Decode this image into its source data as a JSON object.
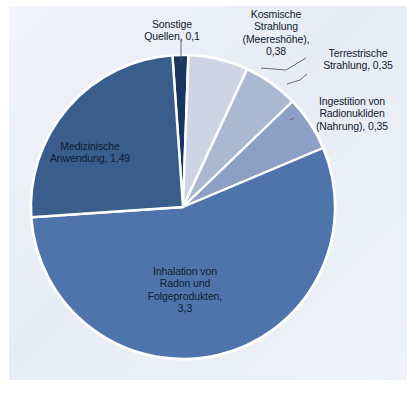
{
  "figure": {
    "background_color": "#e2e8f4",
    "page_color": "#ffffff",
    "slice_border_color": "#ffffff",
    "leader_line_color": "#5a5a5a",
    "text_color": "#0f1a2e"
  },
  "chart_data": {
    "type": "pie",
    "title": "",
    "subtitle": "",
    "xlabel": "",
    "ylabel": "",
    "legend_position": "none",
    "grid": false,
    "total": 5.97,
    "unit_separator_decimal": ",",
    "start_angle_deg": -4,
    "direction": "clockwise",
    "categories": [
      "Sonstige Quellen",
      "Kosmische Strahlung (Meereshöhe)",
      "Terrestrische Strahlung",
      "Ingestition von Radionukliden (Nahrung)",
      "Inhalation von Radon und Folgeprodukten",
      "Medizinische Anwendung"
    ],
    "values": [
      0.1,
      0.38,
      0.35,
      0.35,
      3.3,
      1.49
    ],
    "colors": [
      "#1b3561",
      "#cdd5e4",
      "#aab8d2",
      "#8ba0c4",
      "#4e74ab",
      "#3a5e8c"
    ],
    "slices": [
      {
        "name": "sonstige-quellen",
        "label": "Sonstige\nQuellen, 0,1",
        "value": 0.1,
        "color": "#1b3561",
        "label_placement": "callout"
      },
      {
        "name": "kosmische-strahlung",
        "label": "Kosmische\nStrahlung\n(Meereshöhe),\n0,38",
        "value": 0.38,
        "color": "#cdd5e4",
        "label_placement": "callout"
      },
      {
        "name": "terrestrische-strahlung",
        "label": "Terrestrische\nStrahlung, 0,35",
        "value": 0.35,
        "color": "#aab8d2",
        "label_placement": "callout"
      },
      {
        "name": "ingestition-radionukliden",
        "label": "Ingestition von\nRadionukliden\n(Nahrung), 0,35",
        "value": 0.35,
        "color": "#8ba0c4",
        "label_placement": "callout"
      },
      {
        "name": "inhalation-radon",
        "label": "Inhalation von\nRadon und\nFolgeprodukten,\n3,3",
        "value": 3.3,
        "color": "#4e74ab",
        "label_placement": "inside"
      },
      {
        "name": "medizinische-anwendung",
        "label": "Medizinische\nAnwendung, 1,49",
        "value": 1.49,
        "color": "#3a5e8c",
        "label_placement": "inside"
      }
    ]
  }
}
